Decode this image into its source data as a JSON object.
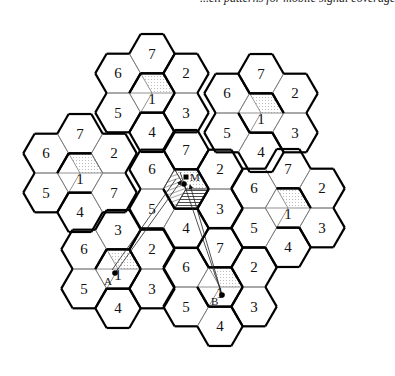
{
  "header": {
    "text": "...ell patterns for mobile signal coverage"
  },
  "figure": {
    "hex_radius": 22.7,
    "center_cell": {
      "x": 186,
      "y": 189
    },
    "cell_offsets": {
      "1": [
        0,
        0
      ],
      "7": [
        0,
        -1
      ],
      "2": [
        1,
        -0.5
      ],
      "3": [
        1,
        0.5
      ],
      "4": [
        0,
        1
      ],
      "5": [
        -1,
        0.5
      ],
      "6": [
        -1,
        -0.5
      ]
    },
    "clusters": [
      {
        "name": "top",
        "center": [
          152,
          93
        ],
        "labels": {
          "1": "1",
          "2": "2",
          "3": "3",
          "4": "4",
          "5": "5",
          "6": "6",
          "7": "7"
        },
        "dotted": true
      },
      {
        "name": "top-right",
        "center": [
          261,
          113
        ],
        "labels": {
          "1": "1",
          "2": "2",
          "3": "3",
          "4": "4",
          "5": "5",
          "6": "6",
          "7": "7"
        },
        "dotted": true
      },
      {
        "name": "left",
        "center": [
          80,
          173
        ],
        "labels": {
          "1": "1",
          "2": "2",
          "3": "7",
          "4": "4",
          "5": "5",
          "6": "6",
          "7": "7"
        },
        "dotted": true
      },
      {
        "name": "center",
        "center": [
          186,
          189
        ],
        "labels": {
          "1": "",
          "2": "2",
          "3": "3",
          "4": "4",
          "5": "5",
          "6": "6",
          "7": "7"
        },
        "dotted": false
      },
      {
        "name": "right",
        "center": [
          288,
          208
        ],
        "labels": {
          "1": "1",
          "2": "2",
          "3": "3",
          "4": "4",
          "5": "5",
          "6": "6",
          "7": "7"
        },
        "dotted": true
      },
      {
        "name": "bottom-left",
        "center": [
          118,
          269
        ],
        "labels": {
          "1": "1",
          "2": "2",
          "3": "3",
          "4": "4",
          "5": "5",
          "6": "6",
          "7": "3"
        },
        "dotted": true
      },
      {
        "name": "bottom",
        "center": [
          220,
          287
        ],
        "labels": {
          "1": "1",
          "2": "2",
          "3": "3",
          "4": "4",
          "5": "5",
          "6": "6",
          "7": "7"
        },
        "dotted": true
      }
    ],
    "points": [
      {
        "id": "M",
        "label": "M",
        "x": 186,
        "y": 177,
        "marker": "square",
        "label_dx": 4,
        "label_dy": 0
      },
      {
        "id": "center-dot",
        "label": "",
        "x": 184,
        "y": 184,
        "marker": "circle"
      },
      {
        "id": "A",
        "label": "A",
        "x": 115,
        "y": 273,
        "marker": "circle",
        "label_dx": -11,
        "label_dy": 8
      },
      {
        "id": "B",
        "label": "B",
        "x": 222,
        "y": 295,
        "marker": "circle",
        "label_dx": -11,
        "label_dy": 6
      }
    ],
    "rays": [
      {
        "from": [
          115,
          273
        ],
        "to": [
          181,
          181
        ],
        "arrow": true
      },
      {
        "from": [
          112,
          270
        ],
        "to": [
          176,
          179
        ],
        "arrow": false
      },
      {
        "from": [
          222,
          295
        ],
        "to": [
          190,
          185
        ],
        "arrow": true
      },
      {
        "from": [
          222,
          295
        ],
        "to": [
          180,
          172
        ],
        "arrow": false
      }
    ]
  }
}
